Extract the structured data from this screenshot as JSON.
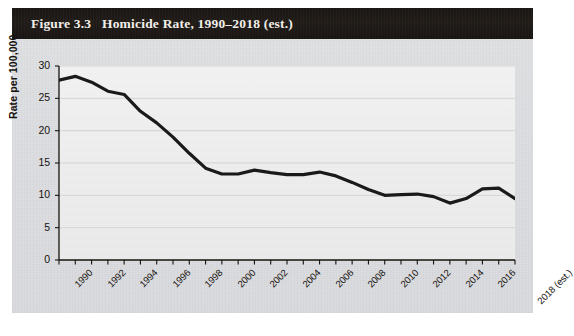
{
  "figure": {
    "label": "Figure 3.3",
    "title": "Homicide Rate, 1990–2018 (est.)",
    "title_full": "Figure 3.3   Homicide Rate, 1990–2018 (est.)",
    "panel_color": "#dcdde0",
    "title_bar_color": "#1b1715",
    "title_text_color": "#f2efe9",
    "line_color": "#1a1a1a",
    "plot_background": "#efefef",
    "gridline_color": "#d3d3d5"
  },
  "chart_data": {
    "type": "line",
    "title": "Homicide Rate, 1990–2018 (est.)",
    "xlabel": "",
    "ylabel": "Rate per 100,000",
    "xlim": [
      1990,
      2018
    ],
    "ylim": [
      0,
      30
    ],
    "grid": "horizontal",
    "legend": "none",
    "y_ticks": [
      0,
      5,
      10,
      15,
      20,
      25,
      30
    ],
    "y_tick_labels": [
      "0",
      "5",
      "10",
      "15",
      "20",
      "25",
      "30"
    ],
    "x_ticks": [
      1990,
      1991,
      1992,
      1993,
      1994,
      1995,
      1996,
      1997,
      1998,
      1999,
      2000,
      2001,
      2002,
      2003,
      2004,
      2005,
      2006,
      2007,
      2008,
      2009,
      2010,
      2011,
      2012,
      2013,
      2014,
      2015,
      2016,
      2017,
      2018
    ],
    "x_tick_labels": [
      {
        "x": 1990,
        "label": "1990"
      },
      {
        "x": 1992,
        "label": "1992"
      },
      {
        "x": 1994,
        "label": "1994"
      },
      {
        "x": 1996,
        "label": "1996"
      },
      {
        "x": 1998,
        "label": "1998"
      },
      {
        "x": 2000,
        "label": "2000"
      },
      {
        "x": 2002,
        "label": "2002"
      },
      {
        "x": 2004,
        "label": "2004"
      },
      {
        "x": 2006,
        "label": "2006"
      },
      {
        "x": 2008,
        "label": "2008"
      },
      {
        "x": 2010,
        "label": "2010"
      },
      {
        "x": 2012,
        "label": "2012"
      },
      {
        "x": 2014,
        "label": "2014"
      },
      {
        "x": 2016,
        "label": "2016"
      },
      {
        "x": 2018,
        "label": "2018 (est.)"
      }
    ],
    "x": [
      1990,
      1991,
      1992,
      1993,
      1994,
      1995,
      1996,
      1997,
      1998,
      1999,
      2000,
      2001,
      2002,
      2003,
      2004,
      2005,
      2006,
      2007,
      2008,
      2009,
      2010,
      2011,
      2012,
      2013,
      2014,
      2015,
      2016,
      2017,
      2018
    ],
    "values": [
      27.8,
      28.4,
      27.5,
      26.1,
      25.6,
      23.0,
      21.2,
      19.0,
      16.5,
      14.2,
      13.3,
      13.3,
      13.9,
      13.5,
      13.2,
      13.2,
      13.6,
      13.0,
      12.0,
      10.9,
      10.0,
      10.1,
      10.2,
      9.8,
      8.8,
      9.5,
      11.0,
      11.1,
      9.5
    ],
    "series": [
      {
        "name": "Homicide rate per 100,000",
        "color": "#1a1a1a",
        "values": [
          27.8,
          28.4,
          27.5,
          26.1,
          25.6,
          23.0,
          21.2,
          19.0,
          16.5,
          14.2,
          13.3,
          13.3,
          13.9,
          13.5,
          13.2,
          13.2,
          13.6,
          13.0,
          12.0,
          10.9,
          10.0,
          10.1,
          10.2,
          9.8,
          8.8,
          9.5,
          11.0,
          11.1,
          9.5
        ]
      }
    ]
  }
}
